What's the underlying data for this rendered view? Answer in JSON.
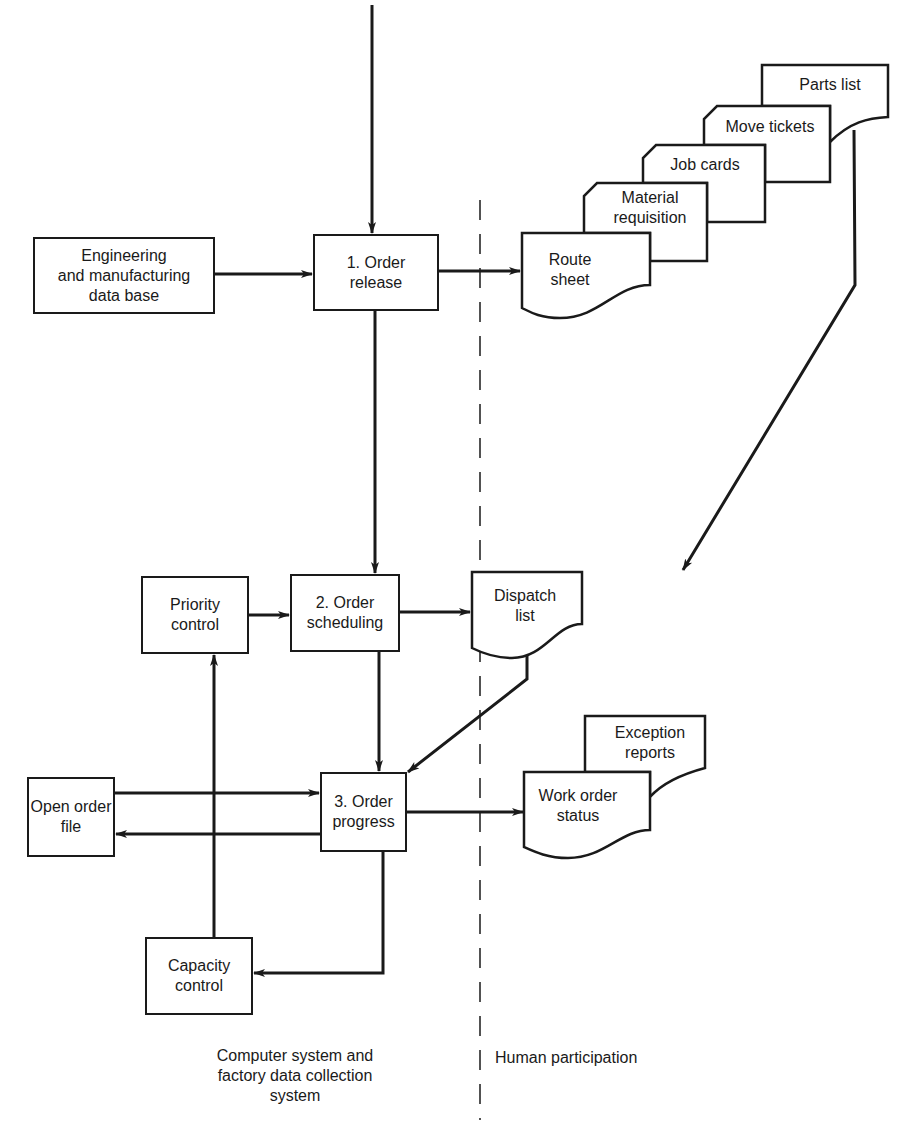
{
  "diagram": {
    "process_boxes": {
      "engineering_db": "Engineering\nand manufacturing\ndata base",
      "order_release": "1. Order\nrelease",
      "priority_control": "Priority\ncontrol",
      "order_scheduling": "2. Order\nscheduling",
      "open_order_file": "Open order\nfile",
      "order_progress": "3. Order\nprogress",
      "capacity_control": "Capacity\ncontrol"
    },
    "documents": {
      "route_sheet": "Route\nsheet",
      "material_requisition": "Material\nrequisition",
      "job_cards": "Job cards",
      "move_tickets": "Move tickets",
      "parts_list": "Parts list",
      "dispatch_list": "Dispatch\nlist",
      "work_order_status": "Work order\nstatus",
      "exception_reports": "Exception\nreports"
    },
    "regions": {
      "computer_system": "Computer system and\nfactory data collection\nsystem",
      "human_participation": "Human participation"
    },
    "colors": {
      "line": "#1a1a1a",
      "background": "#ffffff"
    }
  }
}
